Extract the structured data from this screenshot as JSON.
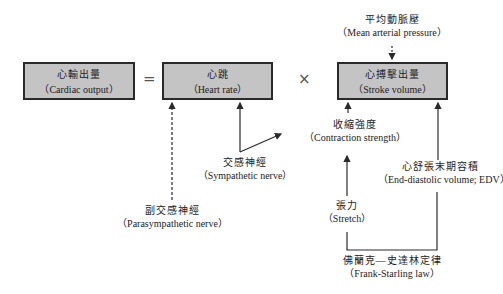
{
  "boxes": {
    "cardiac_output": {
      "zh": "心輸出量",
      "en": "（Cardiac output）"
    },
    "heart_rate": {
      "zh": "心跳",
      "en": "（Heart rate）"
    },
    "stroke_volume": {
      "zh": "心搏擊出量",
      "en": "（Stroke volume）"
    }
  },
  "operators": {
    "equals": "=",
    "times": "×"
  },
  "labels": {
    "mean_arterial_pressure": {
      "zh": "平均動脈壓",
      "en": "（Mean arterial pressure）"
    },
    "contraction_strength": {
      "zh": "收縮強度",
      "en": "（Contraction strength）"
    },
    "sympathetic_nerve": {
      "zh": "交感神經",
      "en": "（Sympathetic nerve）"
    },
    "end_diastolic_volume": {
      "zh": "心舒張末期容積",
      "en": "（End-diastolic volume; EDV）"
    },
    "parasympathetic_nerve": {
      "zh": "副交感神經",
      "en": "（Parasympathetic nerve）"
    },
    "stretch": {
      "zh": "張力",
      "en": "（Stretch）"
    },
    "frank_starling": {
      "zh": "佛蘭克—史達林定律",
      "en": "（Frank-Starling law）"
    }
  },
  "colors": {
    "box_fill": "#c4c4c4",
    "line": "#2a2a2a"
  }
}
